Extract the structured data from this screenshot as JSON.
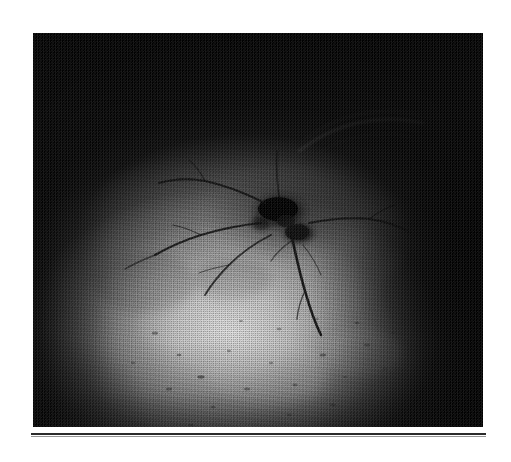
{
  "page": {
    "background_color": "#ffffff",
    "width": 511,
    "height": 462,
    "kind": "scanned-document-page"
  },
  "figure": {
    "name": "grayscale-photograph",
    "frame": {
      "x": 33,
      "y": 33,
      "width": 450,
      "height": 394
    },
    "dominant_colors": {
      "darkest": "#060606",
      "mid_tone": "#6e6e6e",
      "brightest": "#e2e2e2",
      "crack_ink": "#101010"
    },
    "lighting": {
      "description": "radial illumination, bright lower-centre falling off to black corners",
      "highlight_center_x_pct": 44,
      "highlight_center_y_pct": 76
    },
    "texture": "halftone print screen with film grain and horizontal scan banding"
  },
  "rule": {
    "name": "figure-separator-rule",
    "color": "#2b2b2b",
    "shadow_color": "#969696",
    "x": 31,
    "y": 433,
    "width": 455,
    "thickness": 2
  },
  "chart_data": {
    "type": "image",
    "title": "",
    "features": [
      {
        "name": "central-impact-blob",
        "cx": 0.555,
        "cy": 0.465,
        "rx": 0.072,
        "ry": 0.055,
        "tone": "very-dark"
      },
      {
        "name": "secondary-blob",
        "cx": 0.578,
        "cy": 0.505,
        "rx": 0.042,
        "ry": 0.032,
        "tone": "very-dark"
      },
      {
        "name": "radial-crack-descending",
        "path": "from centre down to lower-right",
        "tone": "dark"
      },
      {
        "name": "crack-network-left",
        "path": "branching horizontal network toward left",
        "tone": "dark"
      },
      {
        "name": "arc-upper-right",
        "path": "faint curved arc in upper-right quadrant",
        "tone": "mid"
      },
      {
        "name": "speckle-field-lower",
        "path": "scattered dark pits across bright lower half",
        "tone": "dark"
      }
    ]
  }
}
